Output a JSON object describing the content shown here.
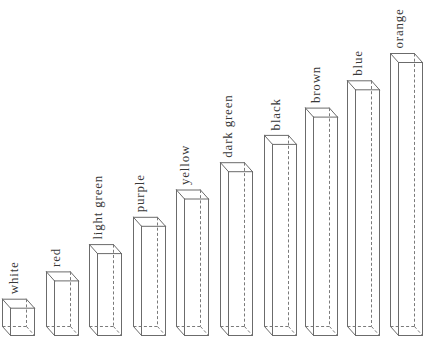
{
  "diagram": {
    "type": "cuisenaire-rods",
    "colors": {
      "line": "#6b6b6b",
      "text": "#383838",
      "background": "#ffffff"
    },
    "rods": [
      {
        "name": "white",
        "length": 1
      },
      {
        "name": "red",
        "length": 2
      },
      {
        "name": "light green",
        "length": 3
      },
      {
        "name": "purple",
        "length": 4
      },
      {
        "name": "yellow",
        "length": 5
      },
      {
        "name": "dark green",
        "length": 6
      },
      {
        "name": "black",
        "length": 7
      },
      {
        "name": "brown",
        "length": 8
      },
      {
        "name": "blue",
        "length": 9
      },
      {
        "name": "orange",
        "length": 10
      }
    ]
  }
}
